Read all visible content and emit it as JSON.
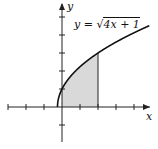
{
  "chart_data": {
    "type": "area",
    "title": "",
    "equation_label": "y = √(4x + 1)",
    "equation_parts": {
      "lhs": "y",
      "eq": "=",
      "radicand": "4x + 1"
    },
    "xlabel": "x",
    "ylabel": "y",
    "function": "sqrt(4x+1)",
    "domain_start": -0.25,
    "shaded_region": {
      "x_from": 0,
      "x_to": 2
    },
    "xlim": [
      -3,
      5
    ],
    "ylim": [
      -2.5,
      5.5
    ],
    "x_ticks": [
      -3,
      -2,
      -1,
      1,
      2,
      3,
      4
    ],
    "y_ticks": [
      -1,
      1,
      2,
      3,
      4,
      5
    ],
    "grid": false,
    "colors": {
      "curve": "#111111",
      "shade": "#d9d9d9",
      "axis": "#222222"
    }
  }
}
